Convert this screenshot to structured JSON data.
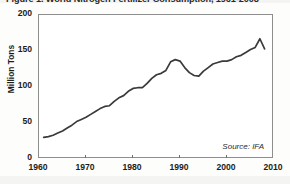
{
  "figure": {
    "title": "Figure 1. World Nitrogen Fertilizer Consumption, 1961-2008",
    "source_note": "Source: IFA"
  },
  "chart_data": {
    "type": "line",
    "title": "Figure 1. World Nitrogen Fertilizer Consumption, 1961-2008",
    "xlabel": "",
    "ylabel": "Million Tons",
    "xlim": [
      1960,
      2010
    ],
    "ylim": [
      0,
      200
    ],
    "xticks": [
      1960,
      1970,
      1980,
      1990,
      2000,
      2010
    ],
    "yticks": [
      0,
      50,
      100,
      150,
      200
    ],
    "grid": false,
    "legend": false,
    "line_color": "#3a3a3a",
    "x": [
      1961,
      1962,
      1963,
      1964,
      1965,
      1966,
      1967,
      1968,
      1969,
      1970,
      1971,
      1972,
      1973,
      1974,
      1975,
      1976,
      1977,
      1978,
      1979,
      1980,
      1981,
      1982,
      1983,
      1984,
      1985,
      1986,
      1987,
      1988,
      1989,
      1990,
      1991,
      1992,
      1993,
      1994,
      1995,
      1996,
      1997,
      1998,
      1999,
      2000,
      2001,
      2002,
      2003,
      2004,
      2005,
      2006,
      2007,
      2008
    ],
    "values": [
      30,
      31,
      33,
      36,
      39,
      43,
      47,
      52,
      55,
      58,
      62,
      66,
      70,
      73,
      74,
      80,
      85,
      88,
      94,
      98,
      99,
      99,
      105,
      112,
      117,
      119,
      123,
      135,
      138,
      136,
      127,
      120,
      116,
      115,
      122,
      127,
      132,
      134,
      136,
      136,
      138,
      142,
      144,
      148,
      152,
      155,
      167,
      153
    ],
    "annotations": [
      {
        "text": "Source: IFA",
        "position": "inside bottom-right"
      }
    ]
  },
  "axes": {
    "y_ticks": [
      {
        "label": "200",
        "value": 200
      },
      {
        "label": "150",
        "value": 150
      },
      {
        "label": "100",
        "value": 100
      },
      {
        "label": "50",
        "value": 50
      },
      {
        "label": "0",
        "value": 0
      }
    ],
    "x_ticks": [
      {
        "label": "1960",
        "value": 1960
      },
      {
        "label": "1970",
        "value": 1970
      },
      {
        "label": "1980",
        "value": 1980
      },
      {
        "label": "1990",
        "value": 1990
      },
      {
        "label": "2000",
        "value": 2000
      },
      {
        "label": "2010",
        "value": 2010
      }
    ],
    "y_axis_title": "Million Tons"
  }
}
